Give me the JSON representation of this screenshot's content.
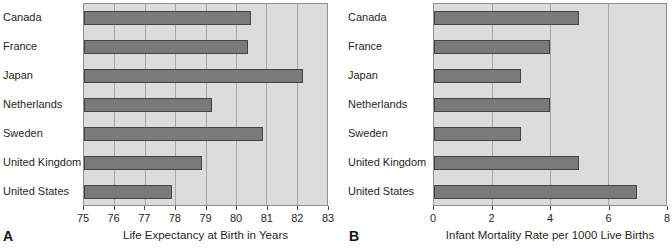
{
  "colors": {
    "page_bg": "#ffffff",
    "plot_bg": "#dcdcdc",
    "plot_border": "#909090",
    "gridline": "#a6a6a6",
    "bar_fill": "#7a7a7a",
    "bar_border": "#434343",
    "axis": "#4a4a4a",
    "text": "#1f1f1f"
  },
  "chart_data": [
    {
      "type": "bar",
      "orientation": "horizontal",
      "panel_label": "A",
      "title": "",
      "xlabel": "Life Expectancy at Birth in Years",
      "ylabel": "",
      "categories": [
        "Canada",
        "France",
        "Japan",
        "Netherlands",
        "Sweden",
        "United Kingdom",
        "United States"
      ],
      "values": [
        80.5,
        80.4,
        82.2,
        79.2,
        80.9,
        78.9,
        77.9
      ],
      "xlim": [
        75,
        83
      ],
      "xticks": [
        75,
        76,
        77,
        78,
        79,
        80,
        81,
        82,
        83
      ],
      "xtick_labels": [
        "75",
        "76",
        "77",
        "78",
        "79",
        "80",
        "81",
        "82",
        "83"
      ],
      "grid": true,
      "legend": false
    },
    {
      "type": "bar",
      "orientation": "horizontal",
      "panel_label": "B",
      "title": "",
      "xlabel": "Infant Mortality Rate per 1000 Live Births",
      "ylabel": "",
      "categories": [
        "Canada",
        "France",
        "Japan",
        "Netherlands",
        "Sweden",
        "United Kingdom",
        "United States"
      ],
      "values": [
        5,
        4,
        3,
        4,
        3,
        5,
        7
      ],
      "xlim": [
        0,
        8
      ],
      "xticks": [
        0,
        2,
        4,
        6,
        8
      ],
      "xtick_labels": [
        "0",
        "2",
        "4",
        "6",
        "8"
      ],
      "grid": true,
      "legend": false
    }
  ]
}
